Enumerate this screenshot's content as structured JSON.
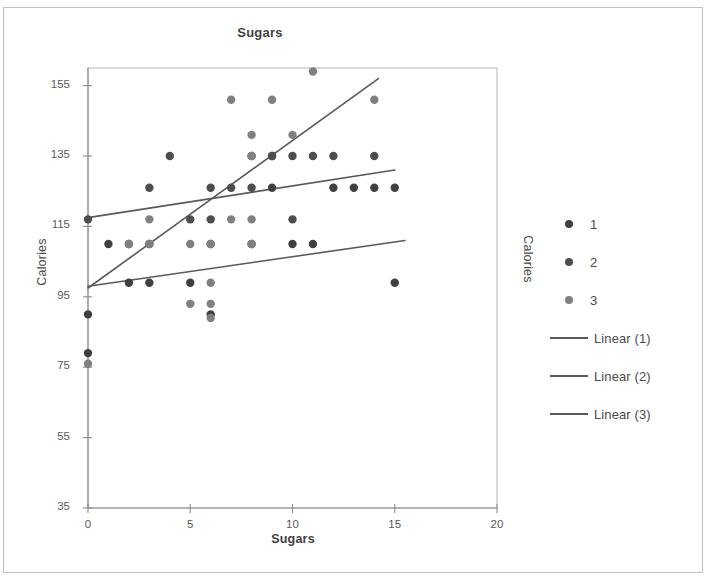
{
  "chart_data": {
    "type": "scatter",
    "title": "Sugars",
    "xlabel": "Sugars",
    "ylabel": "Calories",
    "ylabel_secondary": "Calories",
    "xlim": [
      0,
      20
    ],
    "ylim": [
      35,
      160
    ],
    "xticks": [
      0,
      5,
      10,
      15,
      20
    ],
    "yticks": [
      35,
      55,
      75,
      95,
      115,
      135,
      155
    ],
    "grid": false,
    "legend_position": "right",
    "series": [
      {
        "name": "1",
        "color": "#404040",
        "points": [
          [
            0,
            90
          ],
          [
            0,
            79
          ],
          [
            1,
            110
          ],
          [
            2,
            99
          ],
          [
            3,
            110
          ],
          [
            3,
            99
          ],
          [
            5,
            99
          ],
          [
            6,
            90
          ],
          [
            8,
            110
          ],
          [
            9,
            135
          ],
          [
            10,
            110
          ],
          [
            11,
            110
          ],
          [
            12,
            126
          ],
          [
            13,
            126
          ],
          [
            14,
            126
          ],
          [
            15,
            126
          ],
          [
            15,
            99
          ],
          [
            6,
            110
          ],
          [
            9,
            126
          ]
        ]
      },
      {
        "name": "2",
        "color": "#4d4d4d",
        "points": [
          [
            0,
            117
          ],
          [
            2,
            110
          ],
          [
            3,
            126
          ],
          [
            4,
            135
          ],
          [
            5,
            117
          ],
          [
            6,
            126
          ],
          [
            6,
            117
          ],
          [
            7,
            126
          ],
          [
            8,
            135
          ],
          [
            8,
            126
          ],
          [
            9,
            135
          ],
          [
            10,
            135
          ],
          [
            11,
            135
          ],
          [
            12,
            135
          ],
          [
            14,
            135
          ],
          [
            10,
            117
          ]
        ]
      },
      {
        "name": "3",
        "color": "#808080",
        "points": [
          [
            0,
            76
          ],
          [
            2,
            110
          ],
          [
            3,
            117
          ],
          [
            5,
            93
          ],
          [
            6,
            93
          ],
          [
            6,
            89
          ],
          [
            6,
            99
          ],
          [
            7,
            151
          ],
          [
            7,
            117
          ],
          [
            8,
            141
          ],
          [
            8,
            135
          ],
          [
            8,
            117
          ],
          [
            9,
            151
          ],
          [
            10,
            141
          ],
          [
            11,
            159
          ],
          [
            14,
            151
          ],
          [
            6,
            110
          ],
          [
            5,
            110
          ],
          [
            8,
            110
          ],
          [
            3,
            110
          ]
        ]
      }
    ],
    "trendlines": [
      {
        "name": "Linear (1)",
        "color": "#595959",
        "x0": 0,
        "y0": 98,
        "x1": 15.5,
        "y1": 111
      },
      {
        "name": "Linear (2)",
        "color": "#595959",
        "x0": 0,
        "y0": 117.5,
        "x1": 15.0,
        "y1": 131
      },
      {
        "name": "Linear (3)",
        "color": "#595959",
        "x0": 0,
        "y0": 97.5,
        "x1": 14.2,
        "y1": 157
      }
    ]
  },
  "legend": {
    "items": [
      {
        "label": "1",
        "kind": "dot",
        "color": "#404040"
      },
      {
        "label": "2",
        "kind": "dot",
        "color": "#4d4d4d"
      },
      {
        "label": "3",
        "kind": "dot",
        "color": "#808080"
      },
      {
        "label": "Linear (1)",
        "kind": "line",
        "color": "#595959"
      },
      {
        "label": "Linear (2)",
        "kind": "line",
        "color": "#595959"
      },
      {
        "label": "Linear (3)",
        "kind": "line",
        "color": "#595959"
      }
    ]
  },
  "axis": {
    "y_tick_labels": [
      "155",
      "135",
      "115",
      "95",
      "75",
      "55",
      "35"
    ],
    "x_tick_labels": [
      "0",
      "5",
      "10",
      "15",
      "20"
    ]
  }
}
